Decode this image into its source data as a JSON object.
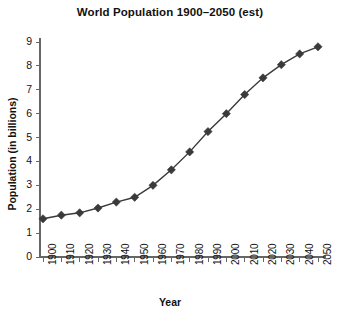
{
  "chart_data": {
    "type": "line",
    "title": "World Population 1900–2050 (est)",
    "xlabel": "Year",
    "ylabel": "Population (in billions)",
    "x": [
      1900,
      1910,
      1920,
      1930,
      1940,
      1950,
      1960,
      1970,
      1980,
      1990,
      2000,
      2010,
      2020,
      2030,
      2040,
      2050
    ],
    "values": [
      1.6,
      1.75,
      1.85,
      2.05,
      2.3,
      2.5,
      3.0,
      3.65,
      4.4,
      5.25,
      6.0,
      6.8,
      7.5,
      8.05,
      8.5,
      8.8
    ],
    "xtick_labels": [
      "1900",
      "1910",
      "1920",
      "1930",
      "1940",
      "1950",
      "1960",
      "1970",
      "1980",
      "1990",
      "2000",
      "2010",
      "2020",
      "2030",
      "2040",
      "2050"
    ],
    "ytick_labels": [
      "0",
      "1",
      "2",
      "3",
      "4",
      "5",
      "6",
      "7",
      "8",
      "9"
    ],
    "yticks": [
      0,
      1,
      2,
      3,
      4,
      5,
      6,
      7,
      8,
      9
    ],
    "xlim": [
      1900,
      2050
    ],
    "ylim": [
      0,
      9
    ],
    "grid": false,
    "legend": false,
    "marker": "diamond",
    "series_color": "#3a3a3a",
    "line_color": "#3a3a3a",
    "axis_color": "#666666",
    "background": "#ffffff"
  }
}
